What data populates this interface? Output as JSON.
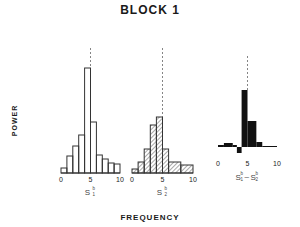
{
  "title": "BLOCK 1",
  "ylabel": "POWER",
  "xlabel": "FREQUENCY",
  "chart_data": [
    {
      "type": "bar",
      "style": "outline",
      "label": "S1^b",
      "label_main": "S",
      "label_sup": "b",
      "label_sub": "1",
      "xlabel": "",
      "ylabel": "POWER",
      "xlim": [
        0,
        10
      ],
      "x_ticks": [
        "0",
        "5",
        "10"
      ],
      "bins": [
        [
          0,
          1
        ],
        [
          1,
          2
        ],
        [
          2,
          3
        ],
        [
          3,
          4
        ],
        [
          4,
          5
        ],
        [
          5,
          6
        ],
        [
          6,
          7
        ],
        [
          7,
          8
        ],
        [
          8,
          9
        ],
        [
          9,
          10
        ]
      ],
      "values": [
        5,
        17,
        27,
        38,
        105,
        51,
        18,
        14,
        10,
        9
      ],
      "dashed_line_x": 5
    },
    {
      "type": "bar",
      "style": "hatched",
      "label": "S2^b",
      "label_main": "S",
      "label_sup": "b",
      "label_sub": "2",
      "xlim": [
        0,
        10
      ],
      "x_ticks": [
        "0",
        "5",
        "10"
      ],
      "bins": [
        [
          0,
          1
        ],
        [
          1,
          2
        ],
        [
          2,
          3
        ],
        [
          3,
          4
        ],
        [
          4,
          5
        ],
        [
          5,
          6
        ],
        [
          6,
          8
        ],
        [
          8,
          10
        ]
      ],
      "values": [
        4,
        11,
        24,
        48,
        56,
        24,
        11,
        8
      ],
      "dashed_line_x": 5
    },
    {
      "type": "bar",
      "style": "filled",
      "label": "S1^b - S2^b",
      "label_main": "S",
      "label_sup": "b",
      "label_sub1": "1",
      "label_sub2": "2",
      "label_minus": "–",
      "xlim": [
        0,
        10
      ],
      "x_ticks": [
        "0",
        "5",
        "10"
      ],
      "bins": [
        [
          0,
          1
        ],
        [
          1,
          2.5
        ],
        [
          2.5,
          3.2
        ],
        [
          3.2,
          4
        ],
        [
          4,
          5
        ],
        [
          5,
          6.5
        ],
        [
          6.5,
          7.5
        ],
        [
          7.5,
          10
        ]
      ],
      "values": [
        2,
        4,
        2,
        -6,
        57,
        26,
        5,
        1
      ],
      "dashed_line_x": 5
    }
  ]
}
